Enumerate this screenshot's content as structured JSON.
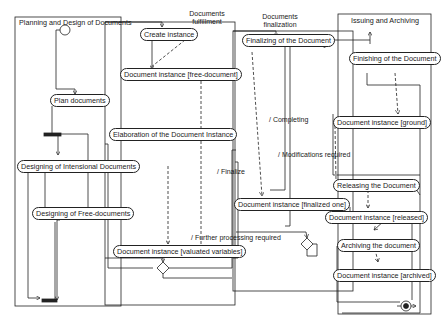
{
  "swimlanes": [
    {
      "id": "planning",
      "title": "Planning and Design of Documents"
    },
    {
      "id": "fulfillment",
      "title": "Documents\nfulfillment",
      "line1": "Documents",
      "line2": "fulfillment"
    },
    {
      "id": "finalization",
      "title": "Documents\nfinalization",
      "line1": "Documents",
      "line2": "finalization"
    },
    {
      "id": "issuing",
      "title": "Issuing and Archiving"
    }
  ],
  "nodes": {
    "plan_documents": "Plan documents",
    "designing_intensional": "Designing of  Intensional Documents",
    "designing_free": "Designing of Free-documents",
    "create_instance": "Create instance",
    "doc_free": "Document instance [free-document]",
    "elaboration": "Elaboration of the  Document Instance",
    "doc_valuated": "Document instance [valuated variables]",
    "finalizing": "Finalizing of the Document",
    "doc_finalized": "Document instance [finalized one]",
    "finishing": "Finishing of the Document",
    "doc_ground": "Document instance [ground]",
    "releasing": "Releasing the Document",
    "doc_released": "Document instance [released]",
    "archiving": "Archiving the document",
    "doc_archived": "Document instance [archived]"
  },
  "transition_labels": {
    "finalize": "/ Finalize",
    "completing": "/ Completing",
    "modifications": "/ Modifications required",
    "further": "/ Further processing required"
  },
  "colors": {
    "line": "#222222",
    "background": "#ffffff"
  }
}
